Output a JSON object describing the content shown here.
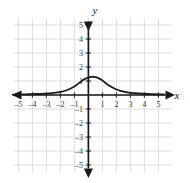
{
  "chart_data": {
    "type": "line",
    "title": "",
    "subtitle": "",
    "xlabel": "x",
    "ylabel": "y",
    "xlim": [
      -5.4,
      5.4
    ],
    "ylim": [
      -5.4,
      5.4
    ],
    "grid": true,
    "legend": null,
    "x_ticks": [
      -5,
      -4,
      -3,
      -2,
      -1,
      1,
      2,
      3,
      4,
      5
    ],
    "y_ticks": [
      5,
      4,
      3,
      2,
      1,
      -1,
      -2,
      -3,
      -4,
      -5
    ],
    "x_tick_labels": [
      "–5",
      "–4",
      "–3",
      "–2",
      "–1",
      "1",
      "2",
      "3",
      "4",
      "5"
    ],
    "y_tick_labels": [
      "5",
      "4",
      "3",
      "2",
      "1",
      "–1",
      "–2",
      "–3",
      "–4",
      "–5"
    ],
    "annotations": [],
    "series": [
      {
        "name": "bell-curve",
        "color": "#1a1a1a",
        "peak_x": 0.4,
        "peak_y": 1.3,
        "x": [
          -5.4,
          -5.0,
          -4.5,
          -4.0,
          -3.5,
          -3.0,
          -2.5,
          -2.0,
          -1.6,
          -1.2,
          -0.9,
          -0.6,
          -0.3,
          0.0,
          0.2,
          0.4,
          0.6,
          0.9,
          1.2,
          1.5,
          1.9,
          2.3,
          2.8,
          3.3,
          3.9,
          4.5,
          5.0,
          5.4
        ],
        "y": [
          0.03,
          0.04,
          0.05,
          0.06,
          0.08,
          0.1,
          0.15,
          0.22,
          0.32,
          0.5,
          0.68,
          0.9,
          1.13,
          1.24,
          1.29,
          1.3,
          1.26,
          1.1,
          0.88,
          0.66,
          0.45,
          0.3,
          0.19,
          0.13,
          0.09,
          0.06,
          0.05,
          0.04
        ]
      }
    ]
  },
  "axes_labels": {
    "x_axis_name": "x",
    "y_axis_name": "y"
  },
  "colors": {
    "grid": "#d9d9d9",
    "axis": "#1a1a1a",
    "curve": "#1a1a1a",
    "background": "#ffffff",
    "tick_text": "#3a3a3a"
  }
}
